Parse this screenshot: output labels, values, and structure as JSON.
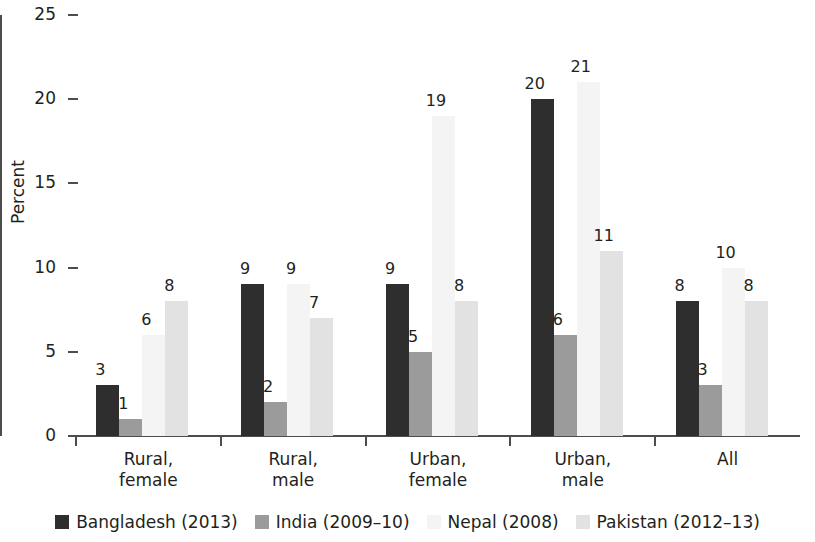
{
  "chart_data": {
    "type": "bar",
    "title": "",
    "xlabel": "",
    "ylabel": "Percent",
    "ylim": [
      0,
      25
    ],
    "ytick_values": [
      0,
      5,
      10,
      15,
      20,
      25
    ],
    "ytick_labels": [
      "0",
      "5",
      "10",
      "15",
      "20",
      "25"
    ],
    "grid": false,
    "legend_position": "bottom",
    "categories": [
      "Rural,\nfemale",
      "Rural,\nmale",
      "Urban,\nfemale",
      "Urban,\nmale",
      "All"
    ],
    "category_lines": [
      [
        "Rural,",
        "female"
      ],
      [
        "Rural,",
        "male"
      ],
      [
        "Urban,",
        "female"
      ],
      [
        "Urban,",
        "male"
      ],
      [
        "All",
        ""
      ]
    ],
    "series": [
      {
        "name": "Bangladesh (2013)",
        "color": "#2e2e2e",
        "values": [
          3,
          9,
          9,
          20,
          8
        ],
        "labels": [
          "3",
          "9",
          "9",
          "20",
          "8"
        ]
      },
      {
        "name": "India (2009–10)",
        "color": "#9b9b9b",
        "values": [
          1,
          2,
          5,
          6,
          3
        ],
        "labels": [
          "1",
          "2",
          "5",
          "6",
          "3"
        ]
      },
      {
        "name": "Nepal (2008)",
        "color": "#f4f4f4",
        "values": [
          6,
          9,
          19,
          21,
          10
        ],
        "labels": [
          "6",
          "9",
          "19",
          "21",
          "10"
        ]
      },
      {
        "name": "Pakistan (2012–13)",
        "color": "#e2e2e2",
        "values": [
          8,
          7,
          8,
          11,
          8
        ],
        "labels": [
          "8",
          "7",
          "8",
          "11",
          "8"
        ]
      }
    ]
  },
  "axis": {
    "y_title": "Percent"
  }
}
